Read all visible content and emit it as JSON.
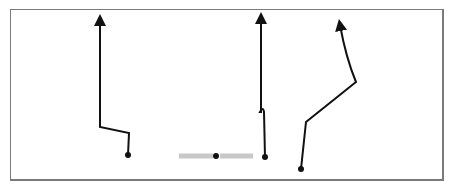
{
  "diagram": {
    "frame_color": "#7a7a7a",
    "stroke_color": "#111111",
    "bar_color": "#c8c8c8",
    "paths": [
      {
        "name": "path-1",
        "points": "100,19 100,127 129,133 128,155",
        "start_dot": [
          128,
          155
        ],
        "arrow_at": [
          100,
          17
        ]
      },
      {
        "name": "path-2",
        "points": "261,17 261,114 262,110 264,110 265,157",
        "start_dot": [
          265,
          157
        ],
        "arrow_at": [
          261,
          15
        ]
      },
      {
        "name": "path-3",
        "points": "301,169 306,122 356,82",
        "curve": "M356,82 Q346,58 340,24",
        "start_dot": [
          301,
          169
        ],
        "arrow_at": [
          340,
          22
        ]
      }
    ],
    "bar": {
      "x1": 179,
      "x2": 253,
      "y": 156,
      "dot_x": 216
    }
  }
}
